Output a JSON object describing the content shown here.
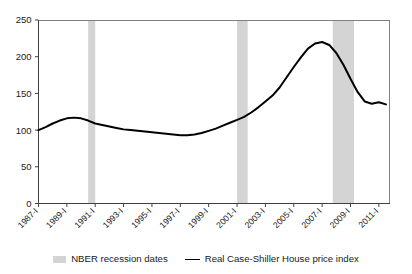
{
  "chart_data": {
    "type": "line",
    "title": "",
    "subtitle": "",
    "xlabel": "",
    "ylabel": "",
    "ylim": [
      0,
      250
    ],
    "yticks": [
      0,
      50,
      100,
      150,
      200,
      250
    ],
    "ytick_labels": [
      "0",
      "50",
      "100",
      "150",
      "200",
      "250"
    ],
    "grid": false,
    "legend_position": "below-plot",
    "xtick_labels": [
      "1987-I",
      "1989-I",
      "1991-I",
      "1993-I",
      "1995-I",
      "1997-I",
      "1999-I",
      "2001-I",
      "2003-I",
      "2005-I",
      "2007-I",
      "2009-I",
      "2011-I"
    ],
    "xlim": [
      "1987-I",
      "2011-IV"
    ],
    "series": [
      {
        "name": "Real Case-Shiller House price index",
        "color": "#000000",
        "x": [
          "1987-I",
          "1987-III",
          "1988-I",
          "1988-III",
          "1989-I",
          "1989-III",
          "1990-I",
          "1990-III",
          "1991-I",
          "1991-III",
          "1992-I",
          "1992-III",
          "1993-I",
          "1993-III",
          "1994-I",
          "1994-III",
          "1995-I",
          "1995-III",
          "1996-I",
          "1996-III",
          "1997-I",
          "1997-III",
          "1998-I",
          "1998-III",
          "1999-I",
          "1999-III",
          "2000-I",
          "2000-III",
          "2001-I",
          "2001-III",
          "2002-I",
          "2002-III",
          "2003-I",
          "2003-III",
          "2004-I",
          "2004-III",
          "2005-I",
          "2005-III",
          "2006-I",
          "2006-III",
          "2007-I",
          "2007-III",
          "2008-I",
          "2008-III",
          "2009-I",
          "2009-III",
          "2010-I",
          "2010-III",
          "2011-I",
          "2011-III"
        ],
        "values": [
          100,
          104,
          109,
          113,
          116,
          117,
          116,
          113,
          109,
          107,
          105,
          103,
          101,
          100,
          99,
          98,
          97,
          96,
          95,
          94,
          93,
          93,
          94,
          96,
          99,
          102,
          106,
          110,
          114,
          118,
          124,
          131,
          139,
          147,
          158,
          172,
          186,
          199,
          211,
          218,
          220,
          216,
          205,
          189,
          170,
          152,
          139,
          136,
          138,
          135
        ]
      }
    ],
    "recession_bands": [
      {
        "label": "1990-1991 recession",
        "start": "1990-III",
        "end": "1991-I"
      },
      {
        "label": "2001 recession",
        "start": "2001-I",
        "end": "2001-IV"
      },
      {
        "label": "2007-2009 recession",
        "start": "2007-IV",
        "end": "2009-II"
      }
    ],
    "band_color": "#d4d4d4"
  },
  "legend": {
    "entries": [
      {
        "label": "NBER recession dates",
        "marker": "band-swatch"
      },
      {
        "label": "Real Case-Shiller House price index",
        "marker": "line-swatch"
      }
    ]
  }
}
